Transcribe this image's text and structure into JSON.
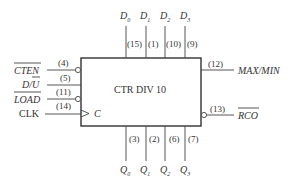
{
  "block": {
    "title": "CTR DIV 10",
    "clock_label": "C"
  },
  "inputs_left": [
    {
      "name": "CTEN",
      "pin": "(4)",
      "overbar": true,
      "italic": true,
      "inverted": true
    },
    {
      "name": "D/U",
      "pin": "(5)",
      "overbar": "U",
      "italic": true,
      "inverted": false
    },
    {
      "name": "LOAD",
      "pin": "(11)",
      "overbar": true,
      "italic": true,
      "inverted": true
    },
    {
      "name": "CLK",
      "pin": "(14)",
      "overbar": false,
      "italic": false,
      "inverted": false,
      "clock": true
    }
  ],
  "inputs_top": [
    {
      "name": "D",
      "sub": "0",
      "pin": "(15)"
    },
    {
      "name": "D",
      "sub": "1",
      "pin": "(1)"
    },
    {
      "name": "D",
      "sub": "2",
      "pin": "(10)"
    },
    {
      "name": "D",
      "sub": "3",
      "pin": "(9)"
    }
  ],
  "outputs_right": [
    {
      "name": "MAX/MIN",
      "pin": "(12)",
      "overbar": false,
      "inverted": false
    },
    {
      "name": "RCO",
      "pin": "(13)",
      "overbar": true,
      "inverted": true
    }
  ],
  "outputs_bottom": [
    {
      "name": "Q",
      "sub": "0",
      "pin": "(3)"
    },
    {
      "name": "Q",
      "sub": "1",
      "pin": "(2)"
    },
    {
      "name": "Q",
      "sub": "2",
      "pin": "(6)"
    },
    {
      "name": "Q",
      "sub": "3",
      "pin": "(7)"
    }
  ]
}
